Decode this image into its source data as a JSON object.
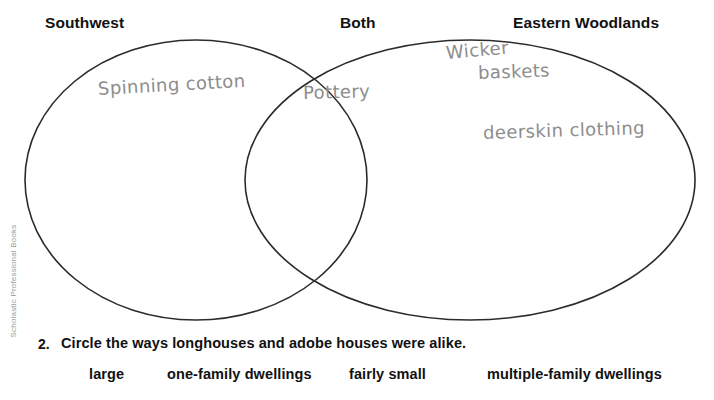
{
  "worksheet": {
    "headings": [
      {
        "id": "southwest",
        "label": "Southwest"
      },
      {
        "id": "both",
        "label": "Both"
      },
      {
        "id": "eastern",
        "label": "Eastern Woodlands"
      }
    ],
    "venn": {
      "left_circle_entries": [
        "Spinning cotton"
      ],
      "overlap_entries": [
        "Pottery"
      ],
      "right_circle_entries": [
        "Wicker",
        "baskets",
        "deerskin clothing"
      ],
      "entries": {
        "spinning_cotton": "Spinning cotton",
        "pottery": "Pottery",
        "wicker": "Wicker",
        "baskets": "baskets",
        "deerskin_clothing": "deerskin clothing"
      },
      "stroke_color": "#2b2b2b",
      "handwriting_color": "#8d8d8d"
    },
    "question": {
      "number": "2.",
      "text": "Circle the ways longhouses and adobe houses were alike.",
      "options": [
        "large",
        "one-family dwellings",
        "fairly small",
        "multiple-family dwellings"
      ]
    },
    "publisher_credit": "Scholastic Professional Books"
  }
}
